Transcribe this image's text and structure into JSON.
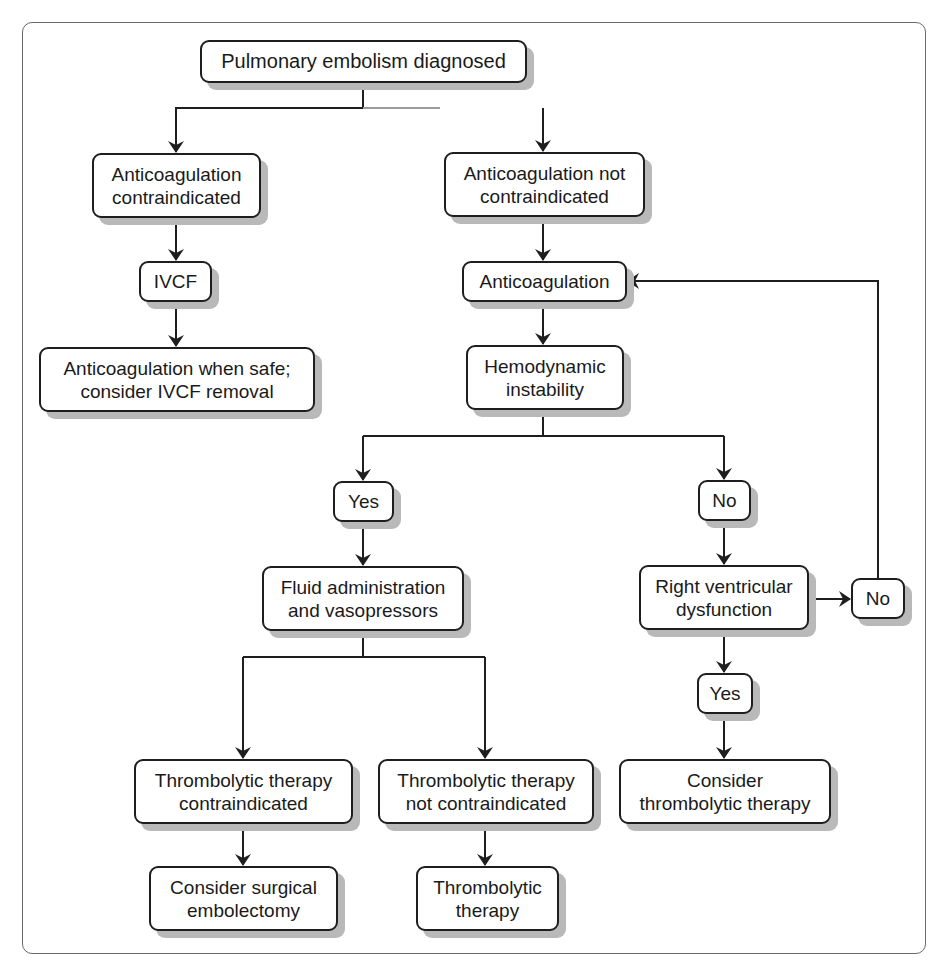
{
  "diagram": {
    "colors": {
      "stroke": "#1e1e1e",
      "shadow": "#b9b9b9",
      "frame": "#6a6a6a",
      "background": "#ffffff"
    },
    "nodes": {
      "pe_diagnosed": {
        "label": "Pulmonary embolism diagnosed"
      },
      "anticoag_contra": {
        "label": "Anticoagulation\ncontraindicated"
      },
      "anticoag_not_contra": {
        "label": "Anticoagulation not\ncontraindicated"
      },
      "ivcf": {
        "label": "IVCF"
      },
      "anticoag_when_safe": {
        "label": "Anticoagulation when safe;\nconsider IVCF removal"
      },
      "anticoagulation": {
        "label": "Anticoagulation"
      },
      "hemo_instability": {
        "label": "Hemodynamic\ninstability"
      },
      "yes_instability": {
        "label": "Yes"
      },
      "no_instability": {
        "label": "No"
      },
      "fluid_vaso": {
        "label": "Fluid administration\nand vasopressors"
      },
      "rv_dysfunction": {
        "label": "Right ventricular\ndysfunction"
      },
      "no_rv": {
        "label": "No"
      },
      "yes_rv": {
        "label": "Yes"
      },
      "consider_thrombolytic": {
        "label": "Consider\nthrombolytic therapy"
      },
      "thrombolytic_contra": {
        "label": "Thrombolytic therapy\ncontraindicated"
      },
      "thrombolytic_not_contra": {
        "label": "Thrombolytic therapy\nnot contraindicated"
      },
      "surgical_embolectomy": {
        "label": "Consider surgical\nembolectomy"
      },
      "thrombolytic_therapy": {
        "label": "Thrombolytic\ntherapy"
      }
    },
    "edges": [
      {
        "from": "pe_diagnosed",
        "to": "anticoag_contra"
      },
      {
        "from": "pe_diagnosed",
        "to": "anticoag_not_contra"
      },
      {
        "from": "anticoag_contra",
        "to": "ivcf"
      },
      {
        "from": "ivcf",
        "to": "anticoag_when_safe"
      },
      {
        "from": "anticoag_not_contra",
        "to": "anticoagulation"
      },
      {
        "from": "anticoagulation",
        "to": "hemo_instability"
      },
      {
        "from": "hemo_instability",
        "to": "yes_instability"
      },
      {
        "from": "hemo_instability",
        "to": "no_instability"
      },
      {
        "from": "yes_instability",
        "to": "fluid_vaso"
      },
      {
        "from": "no_instability",
        "to": "rv_dysfunction"
      },
      {
        "from": "rv_dysfunction",
        "to": "no_rv"
      },
      {
        "from": "no_rv",
        "to": "anticoagulation"
      },
      {
        "from": "rv_dysfunction",
        "to": "yes_rv"
      },
      {
        "from": "yes_rv",
        "to": "consider_thrombolytic"
      },
      {
        "from": "fluid_vaso",
        "to": "thrombolytic_contra"
      },
      {
        "from": "fluid_vaso",
        "to": "thrombolytic_not_contra"
      },
      {
        "from": "thrombolytic_contra",
        "to": "surgical_embolectomy"
      },
      {
        "from": "thrombolytic_not_contra",
        "to": "thrombolytic_therapy"
      }
    ]
  }
}
